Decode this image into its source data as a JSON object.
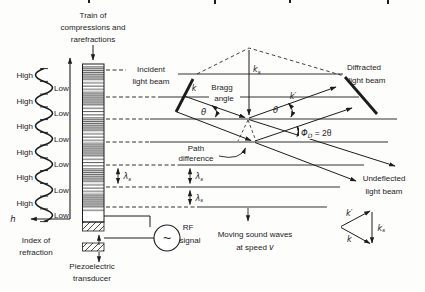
{
  "left_panel": {
    "high": "High",
    "low": "Low",
    "h_axis": "h",
    "index_line1": "Index of",
    "index_line2": "refraction"
  },
  "transducer": {
    "train_line1": "Train of",
    "train_line2": "compressions and",
    "train_line3": "rarefractions",
    "piezo_line1": "Piezoelectric",
    "piezo_line2": "transducer",
    "rf_line1": "RF",
    "rf_line2": "signal",
    "rf_symbol": "~"
  },
  "labels": {
    "incident_line1": "Incident",
    "incident_line2": "light beam",
    "diffracted_line1": "Diffracted",
    "diffracted_line2": "light beam",
    "undeflected_line1": "Undeflected",
    "undeflected_line2": "light beam",
    "bragg_line1": "Bragg",
    "bragg_line2": "angle",
    "path_line1": "Path",
    "path_line2": "difference",
    "sound_line1": "Moving sound waves",
    "sound_line2_pre": "at speed ",
    "sound_speed_symbol": "v",
    "theta": "θ",
    "phi_sym": "Φ",
    "phi_sub": "D",
    "phi_rest": " = 2θ",
    "k": "k",
    "k_prime": "k′",
    "k_sub": "k",
    "lambda_sym": "λ",
    "sub_s": "s"
  },
  "colors": {
    "ink": "#1c1c1c",
    "background": "#fdfdfc"
  }
}
